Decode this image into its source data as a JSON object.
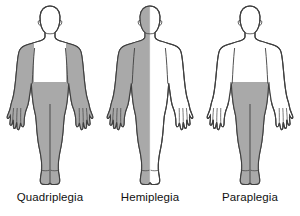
{
  "diagram": {
    "background_color": "#ffffff",
    "outline_color": "#3f3f3f",
    "shaded_color": "#a9a9a9",
    "unshaded_color": "#ffffff",
    "caption_color": "#111111",
    "figures": [
      {
        "id": "quadriplegia",
        "label": "Quadriplegia",
        "affected_regions": "both arms, both legs, lower trunk",
        "shaded_parts": [
          "left-arm",
          "right-arm",
          "pelvis",
          "left-leg",
          "right-leg"
        ],
        "unshaded_parts": [
          "head",
          "neck",
          "chest",
          "abdomen"
        ]
      },
      {
        "id": "hemiplegia",
        "label": "Hemiplegia",
        "affected_regions": "one side of the body",
        "shaded_parts": [
          "left-half-head",
          "left-half-trunk",
          "left-arm",
          "left-leg"
        ],
        "unshaded_parts": [
          "right-half-head",
          "right-half-trunk",
          "right-arm",
          "right-leg"
        ]
      },
      {
        "id": "paraplegia",
        "label": "Paraplegia",
        "affected_regions": "both legs and lower trunk",
        "shaded_parts": [
          "pelvis",
          "left-leg",
          "right-leg"
        ],
        "unshaded_parts": [
          "head",
          "neck",
          "chest",
          "abdomen",
          "left-arm",
          "right-arm"
        ]
      }
    ]
  }
}
